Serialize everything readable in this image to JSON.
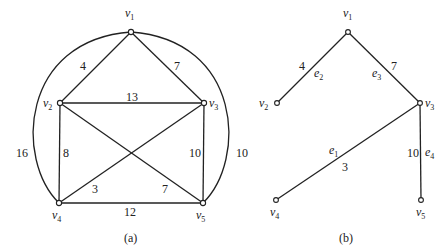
{
  "figure": {
    "left": {
      "caption": "(a)",
      "vertices": [
        {
          "id": "v1",
          "name": "v",
          "sub": "1",
          "x": 131,
          "y": 32,
          "lx": 125,
          "ly": 17
        },
        {
          "id": "v2",
          "name": "v",
          "sub": "2",
          "x": 60,
          "y": 103,
          "lx": 43,
          "ly": 107
        },
        {
          "id": "v3",
          "name": "v",
          "sub": "3",
          "x": 204,
          "y": 103,
          "lx": 209,
          "ly": 107
        },
        {
          "id": "v4",
          "name": "v",
          "sub": "4",
          "x": 59,
          "y": 203,
          "lx": 52,
          "ly": 219
        },
        {
          "id": "v5",
          "name": "v",
          "sub": "5",
          "x": 203,
          "y": 203,
          "lx": 196,
          "ly": 219
        }
      ],
      "edges": [
        {
          "from": "v1",
          "to": "v2",
          "weight": "4",
          "lx": 82,
          "ly": 70
        },
        {
          "from": "v1",
          "to": "v3",
          "weight": "7",
          "lx": 174,
          "ly": 70
        },
        {
          "from": "v2",
          "to": "v3",
          "weight": "13",
          "lx": 126,
          "ly": 101
        },
        {
          "from": "v2",
          "to": "v4",
          "weight": "8",
          "lx": 62,
          "ly": 157
        },
        {
          "from": "v3",
          "to": "v5",
          "weight": "10",
          "lx": 189,
          "ly": 157
        },
        {
          "from": "v4",
          "to": "v3",
          "weight": "3",
          "lx": 92,
          "ly": 193
        },
        {
          "from": "v2",
          "to": "v5",
          "weight": "7",
          "lx": 162,
          "ly": 193
        },
        {
          "from": "v4",
          "to": "v5",
          "weight": "12",
          "lx": 125,
          "ly": 216
        },
        {
          "from": "v1",
          "to": "v4",
          "weight": "16",
          "lx": 17,
          "ly": 157,
          "curved": true
        },
        {
          "from": "v1",
          "to": "v5",
          "weight": "10",
          "lx": 238,
          "ly": 157,
          "curved": true
        }
      ]
    },
    "right": {
      "caption": "(b)",
      "vertices": [
        {
          "id": "v1",
          "name": "v",
          "sub": "1",
          "x": 348,
          "y": 32,
          "lx": 343,
          "ly": 17
        },
        {
          "id": "v2",
          "name": "v",
          "sub": "2",
          "x": 277,
          "y": 103,
          "lx": 258,
          "ly": 107
        },
        {
          "id": "v3",
          "name": "v",
          "sub": "3",
          "x": 420,
          "y": 103,
          "lx": 425,
          "ly": 107
        },
        {
          "id": "v4",
          "name": "v",
          "sub": "4",
          "x": 276,
          "y": 200,
          "lx": 270,
          "ly": 216
        },
        {
          "id": "v5",
          "name": "v",
          "sub": "5",
          "x": 421,
          "y": 200,
          "lx": 416,
          "ly": 216
        }
      ],
      "edges": [
        {
          "from": "v1",
          "to": "v2",
          "weight": "4",
          "wlx": 298,
          "wly": 70,
          "edge_name": "e",
          "edge_sub": "2",
          "elx": 314,
          "ely": 78
        },
        {
          "from": "v1",
          "to": "v3",
          "weight": "7",
          "wlx": 391,
          "wly": 70,
          "edge_name": "e",
          "edge_sub": "3",
          "elx": 372,
          "ely": 78
        },
        {
          "from": "v3",
          "to": "v4",
          "weight": "3",
          "wlx": 343,
          "wly": 170,
          "edge_name": "e",
          "edge_sub": "1",
          "elx": 329,
          "ely": 154
        },
        {
          "from": "v3",
          "to": "v5",
          "weight": "10",
          "wlx": 405,
          "wly": 157,
          "edge_name": "e",
          "edge_sub": "4",
          "elx": 425,
          "ely": 157
        }
      ]
    }
  }
}
